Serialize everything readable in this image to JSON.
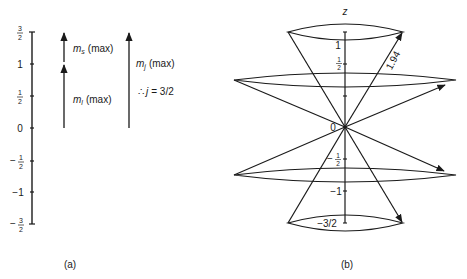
{
  "panel_a": {
    "caption": "(a)",
    "axis_ticks": [
      {
        "label_num": "3",
        "label_den": "2",
        "sign": "",
        "value": 1.5
      },
      {
        "label": "1",
        "value": 1
      },
      {
        "label_num": "1",
        "label_den": "2",
        "sign": "",
        "value": 0.5
      },
      {
        "label": "0",
        "value": 0
      },
      {
        "label_num": "1",
        "label_den": "2",
        "sign": "−",
        "value": -0.5
      },
      {
        "label": "−1",
        "value": -1
      },
      {
        "label_num": "3",
        "label_den": "2",
        "sign": "−",
        "value": -1.5
      }
    ],
    "ml_symbol": "m",
    "ml_sub": "l",
    "ml_text": "(max)",
    "ms_symbol": "m",
    "ms_sub": "s",
    "ms_text": "(max)",
    "mj_symbol": "m",
    "mj_sub": "j",
    "mj_text": "(max)",
    "therefore": "∴",
    "j_eq": "j",
    "j_value": "= 3/2"
  },
  "panel_b": {
    "caption": "(b)",
    "axis_label": "z",
    "origin_label": "0",
    "tick_1": "1",
    "tick_half_num": "1",
    "tick_half_den": "2",
    "tick_neg_half_sign": "−",
    "tick_neg_half_num": "1",
    "tick_neg_half_den": "2",
    "tick_neg_1": "−1",
    "tick_neg_3_2": "−3/2",
    "vector_length": "1.94"
  }
}
